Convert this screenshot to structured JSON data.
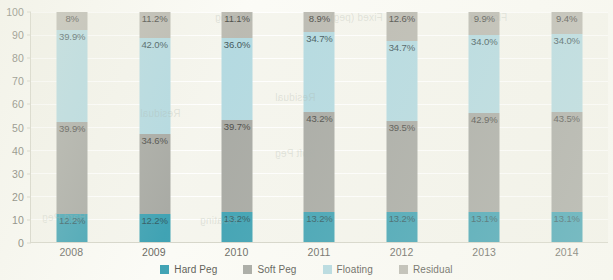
{
  "chart_data": {
    "type": "bar",
    "stacked": true,
    "title": "",
    "subtitle": "",
    "xlabel": "",
    "ylabel": "",
    "ylim": [
      0,
      100
    ],
    "yticks": [
      0,
      10,
      20,
      30,
      40,
      50,
      60,
      70,
      80,
      90,
      100
    ],
    "ytick_labels": [
      "0",
      "10",
      "20",
      "30",
      "40",
      "50",
      "60",
      "70",
      "80",
      "90",
      "100"
    ],
    "grid": true,
    "legend_position": "bottom",
    "categories": [
      "2008",
      "2009",
      "2010",
      "2011",
      "2012",
      "2013",
      "2014"
    ],
    "series": [
      {
        "name": "Hard Peg",
        "color": "#1f93a8",
        "values": [
          12.2,
          12.2,
          13.2,
          13.2,
          13.2,
          13.1,
          13.1
        ],
        "labels": [
          "12.2%",
          "12.2%",
          "13.2%",
          "13.2%",
          "13.2%",
          "13.1%",
          "13.1%"
        ]
      },
      {
        "name": "Soft Peg",
        "color": "#9a9c96",
        "values": [
          39.9,
          34.6,
          39.7,
          43.2,
          39.5,
          42.9,
          43.5
        ],
        "labels": [
          "39.9%",
          "34.6%",
          "39.7%",
          "43.2%",
          "39.5%",
          "42.9%",
          "43.5%"
        ]
      },
      {
        "name": "Floating",
        "color": "#a8d4dd",
        "values": [
          39.9,
          42.0,
          36.0,
          34.7,
          34.7,
          34.0,
          34.0
        ],
        "labels": [
          "39.9%",
          "42.0%",
          "36.0%",
          "34.7%",
          "34.7%",
          "34.0%",
          "34.0%"
        ]
      },
      {
        "name": "Residual",
        "color": "#b0afa6",
        "values": [
          8.0,
          11.2,
          11.1,
          8.9,
          12.6,
          9.9,
          9.4
        ],
        "labels": [
          "8%",
          "11.2%",
          "11.1%",
          "8.9%",
          "12.6%",
          "9.9%",
          "9.4%"
        ]
      }
    ]
  },
  "legend": {
    "items": [
      {
        "label": "Hard Peg",
        "color": "#1f93a8"
      },
      {
        "label": "Soft Peg",
        "color": "#9a9c96"
      },
      {
        "label": "Floating",
        "color": "#a8d4dd"
      },
      {
        "label": "Residual",
        "color": "#b0afa6"
      }
    ]
  },
  "colors": {
    "plot_background": "#f4f4ec",
    "page_background": "#fbfbf6",
    "gridline": "#ffffff",
    "axis": "#cfcfc2",
    "tick_text": "#5a5a52"
  },
  "ghost_text": [
    "Floating",
    "Fixed (peg)",
    "Residual",
    "Hard Peg",
    "Soft Peg"
  ]
}
